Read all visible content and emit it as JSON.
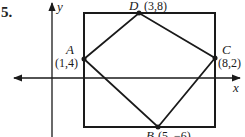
{
  "problem_number": "5.",
  "axes": {
    "x_label": "x",
    "y_label": "y"
  },
  "points": [
    {
      "name": "A",
      "coords": "(1,4)"
    },
    {
      "name": "B",
      "coords": "(5, −6)"
    },
    {
      "name": "C",
      "coords": "(8,2)"
    },
    {
      "name": "D",
      "coords": "(3,8)"
    }
  ],
  "shapes": {
    "rectangle": "bounding rectangle around quadrilateral ABCD",
    "quadrilateral": "A-D-C-B"
  },
  "colors": {
    "stroke": "#1a1a1a",
    "background": "#ffffff"
  }
}
